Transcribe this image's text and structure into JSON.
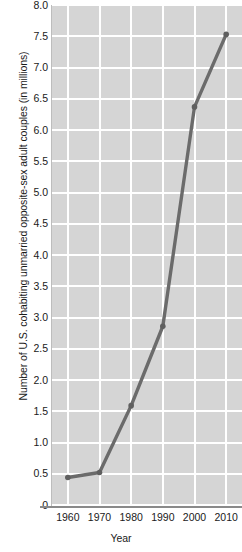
{
  "chart_data": {
    "type": "line",
    "title": "",
    "xlabel": "Year",
    "ylabel": "Number of U.S. cohabiting unmarried opposite-sex adult couples (in millions)",
    "x": [
      1960,
      1970,
      1980,
      1990,
      2000,
      2010
    ],
    "xtick_labels": [
      "1960",
      "1970",
      "1980",
      "1990",
      "2000",
      "2010"
    ],
    "ytick_labels": [
      "0",
      "0.5",
      "1.0",
      "1.5",
      "2.0",
      "2.5",
      "3.0",
      "3.5",
      "4.0",
      "4.5",
      "5.0",
      "5.5",
      "6.0",
      "6.5",
      "7.0",
      "7.5",
      "8.0"
    ],
    "ytick_values": [
      0,
      0.5,
      1.0,
      1.5,
      2.0,
      2.5,
      3.0,
      3.5,
      4.0,
      4.5,
      5.0,
      5.5,
      6.0,
      6.5,
      7.0,
      7.5,
      8.0
    ],
    "series": [
      {
        "name": "Cohabiting unmarried opposite-sex adult couples",
        "values": [
          0.44,
          0.52,
          1.59,
          2.86,
          3.82,
          7.53
        ]
      }
    ],
    "values": [
      0.44,
      0.52,
      1.59,
      2.86,
      6.37,
      7.53
    ],
    "xlim": [
      1955,
      2015
    ],
    "ylim": [
      0,
      8.0
    ],
    "grid": true,
    "legend": "none",
    "plot_background_color": "#d5d5d5",
    "grid_color": "#ffffff",
    "line_color": "#6b6b6b",
    "marker_color": "#5f5f5f"
  }
}
